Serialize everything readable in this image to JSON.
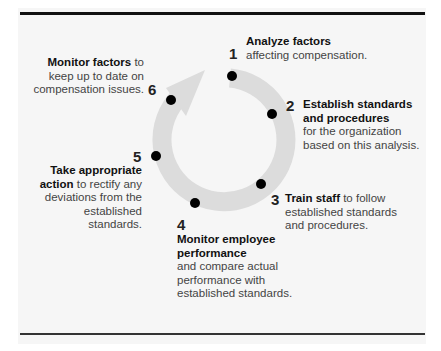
{
  "diagram": {
    "type": "cycle",
    "ring_color": "#d9d9d9",
    "dot_color": "#000000",
    "steps": [
      {
        "number": "1",
        "bold": "Analyze factors",
        "text": "affecting compensation."
      },
      {
        "number": "2",
        "bold": "Establish standards and procedures",
        "text": "for the organization based on this analysis."
      },
      {
        "number": "3",
        "bold": "Train staff",
        "text": "to follow established standards and procedures."
      },
      {
        "number": "4",
        "bold": "Monitor employee performance",
        "text": "and compare actual performance with established standards."
      },
      {
        "number": "5",
        "bold": "Take appropriate action",
        "text": "to rectify any deviations from the established standards."
      },
      {
        "number": "6",
        "bold": "Monitor factors",
        "text": "to keep up to date on compensation issues."
      }
    ]
  }
}
